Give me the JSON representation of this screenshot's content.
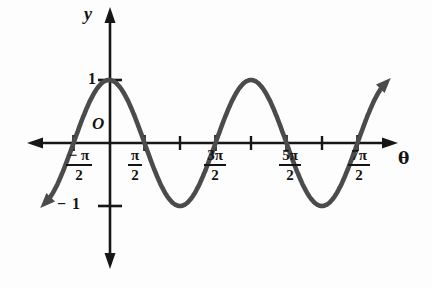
{
  "figure": {
    "y_axis_label": "y",
    "x_axis_label": "θ",
    "origin_label": "O",
    "y_ticks": [
      {
        "label": "1",
        "value": 1
      },
      {
        "label": "− 1",
        "value": -1
      }
    ],
    "x_ticks": [
      {
        "num": "− π",
        "den": "2",
        "value_pi": -0.5,
        "meaning": "-π/2"
      },
      {
        "num": "π",
        "den": "2",
        "value_pi": 0.5,
        "meaning": "π/2"
      },
      {
        "num": "3π",
        "den": "2",
        "value_pi": 1.5,
        "meaning": "3π/2"
      },
      {
        "num": "5π",
        "den": "2",
        "value_pi": 2.5,
        "meaning": "5π/2"
      },
      {
        "num": "7π",
        "den": "2",
        "value_pi": 3.5,
        "meaning": "7π/2"
      }
    ],
    "colors": {
      "axis": "#161616",
      "curve": "#4b4b4b",
      "background": "#fdfdfd"
    }
  },
  "chart_data": {
    "type": "line",
    "title": "",
    "function": "y = cos(θ)",
    "xlabel": "θ",
    "ylabel": "y",
    "ylim": [
      -1,
      1
    ],
    "amplitude": 1,
    "period": "2π",
    "x_range_pi_units": [
      -0.88,
      3.88
    ],
    "x_ticks_labeled_pi_units": [
      -0.5,
      0.5,
      1.5,
      2.5,
      3.5
    ],
    "x_tick_labels": [
      "−π/2",
      "π/2",
      "3π/2",
      "5π/2",
      "7π/2"
    ],
    "x_ticks_unlabeled_pi_units": [
      1,
      2,
      3
    ],
    "y_tick_values": [
      1,
      -1
    ],
    "y_tick_labels": [
      "1",
      "−1"
    ],
    "key_points_pi_units": {
      "zeros": [
        -0.5,
        0.5,
        1.5,
        2.5,
        3.5
      ],
      "maxima": [
        [
          0,
          1
        ],
        [
          2,
          1
        ]
      ],
      "minima": [
        [
          1,
          -1
        ],
        [
          3,
          -1
        ]
      ]
    },
    "grid": false,
    "legend": false
  }
}
